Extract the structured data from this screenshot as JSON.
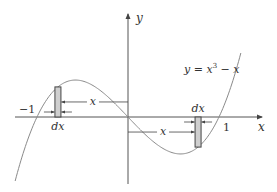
{
  "figure": {
    "function": "x^3 - x",
    "equation_label": {
      "lhs": "y = x",
      "exponent": "3",
      "rhs": " − x"
    },
    "axes": {
      "x_label": "x",
      "y_label": "y"
    },
    "ticks": {
      "neg_one": "−1",
      "one": "1"
    },
    "strips": [
      {
        "side": "left",
        "center_x": -0.77,
        "width_label": "dx",
        "distance_label": "x"
      },
      {
        "side": "right",
        "center_x": 0.77,
        "width_label": "dx",
        "distance_label": "x"
      }
    ],
    "domain": [
      -1.24,
      1.24
    ],
    "colors": {
      "curve": "#8a8a8a",
      "axis": "#555555",
      "strip_fill": "#cfcfcf",
      "strip_stroke": "#444444",
      "text": "#333333"
    }
  }
}
